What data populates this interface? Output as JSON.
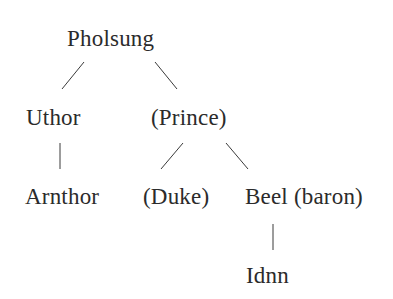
{
  "diagram": {
    "type": "tree",
    "nodes": [
      {
        "id": "pholsung",
        "label": "Pholsung",
        "x": 67,
        "y": 27
      },
      {
        "id": "uthor",
        "label": "Uthor",
        "x": 26,
        "y": 106
      },
      {
        "id": "prince",
        "label": "(Prince)",
        "x": 151,
        "y": 106
      },
      {
        "id": "arnthor",
        "label": "Arnthor",
        "x": 25,
        "y": 185
      },
      {
        "id": "duke",
        "label": "(Duke)",
        "x": 143,
        "y": 185
      },
      {
        "id": "beel",
        "label": "Beel (baron)",
        "x": 245,
        "y": 185
      },
      {
        "id": "idnn",
        "label": "Idnn",
        "x": 246,
        "y": 264
      }
    ],
    "edges": [
      {
        "from": "pholsung",
        "to": "uthor"
      },
      {
        "from": "pholsung",
        "to": "prince"
      },
      {
        "from": "uthor",
        "to": "arnthor"
      },
      {
        "from": "prince",
        "to": "duke"
      },
      {
        "from": "prince",
        "to": "beel"
      },
      {
        "from": "beel",
        "to": "idnn"
      }
    ],
    "colors": {
      "text": "#2b2b2b",
      "line": "#3a3a3a",
      "background": "#ffffff"
    }
  }
}
